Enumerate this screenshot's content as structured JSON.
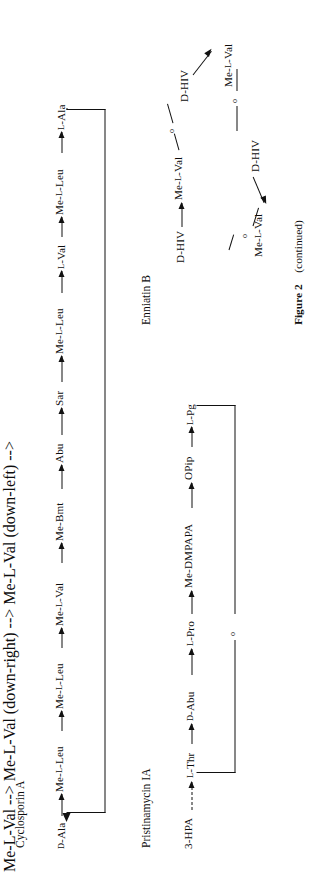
{
  "figure": {
    "caption_label": "Figure 2",
    "caption_note": "(continued)"
  },
  "panels": [
    {
      "id": "cyclosporin-a",
      "title": "Cyclosporin A",
      "type": "cyclic-peptide-chain",
      "residues": [
        "D-Ala",
        "Me-L-Leu",
        "Me-L-Leu",
        "Me-L-Val",
        "Me-Bmt",
        "Abu",
        "Sar",
        "Me-L-Leu",
        "L-Val",
        "Me-L-Leu",
        "L-Ala"
      ],
      "cyclization": "head-to-tail bracket from L-Ala back to D-Ala",
      "bridge_atom": ""
    },
    {
      "id": "pristinamycin-ia",
      "title": "Pristinamycin IA",
      "type": "cyclic-depsipeptide-chain",
      "starter": "3-HPA",
      "starter_link": "dashed-arrow",
      "residues": [
        "L-Thr",
        "D-Abu",
        "L-Pro",
        "Me-DMPAPA",
        "OPip",
        "L-Pg"
      ],
      "cyclization": "lactone bracket from L-Pg back to L-Thr",
      "bridge_atom": "o"
    },
    {
      "id": "enniatin-b",
      "title": "Enniatin B",
      "type": "cyclic-depsipeptide-ring",
      "ring_nodes": [
        {
          "label": "D-HIV",
          "link_out": "arrow"
        },
        {
          "label": "Me-L-Val",
          "link_out": "ester-o"
        },
        {
          "label": "D-HIV",
          "link_out": "arrow"
        },
        {
          "label": "Me-L-Val",
          "link_out": "ester-o"
        },
        {
          "label": "D-HIV",
          "link_out": "arrow"
        },
        {
          "label": "Me-L-Val",
          "link_out": "ester-o"
        }
      ],
      "bridge_atom": "o"
    }
  ],
  "colors": {
    "ink": "#0d0d0d",
    "paper": "#ffffff"
  }
}
